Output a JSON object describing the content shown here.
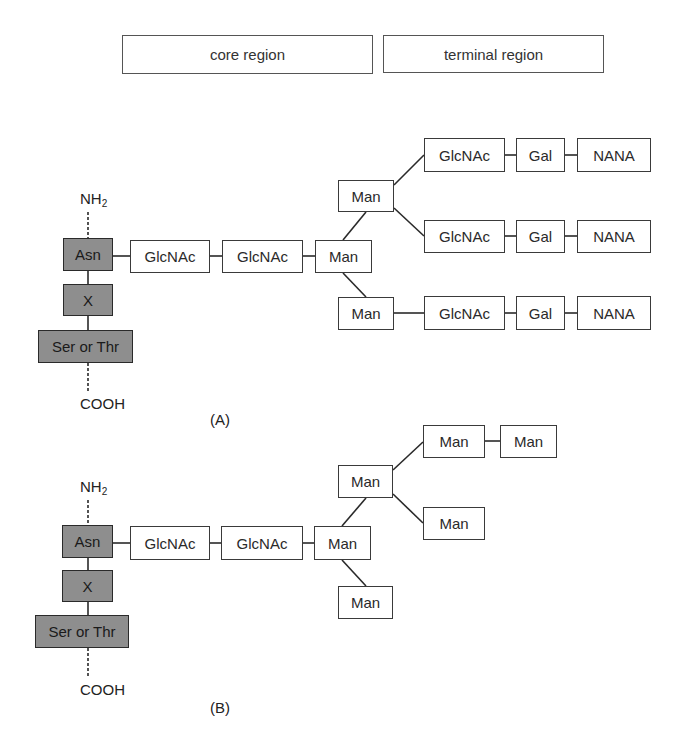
{
  "header": {
    "core_region": "core region",
    "terminal_region": "terminal region"
  },
  "panelA": {
    "caption": "(A)",
    "n_terminus": "NH",
    "n_terminus_sub": "2",
    "c_terminus": "COOH",
    "peptide": [
      "Asn",
      "X",
      "Ser or Thr"
    ],
    "core": [
      "GlcNAc",
      "GlcNAc",
      "Man",
      "Man",
      "Man"
    ],
    "branches": [
      [
        "GlcNAc",
        "Gal",
        "NANA"
      ],
      [
        "GlcNAc",
        "Gal",
        "NANA"
      ],
      [
        "GlcNAc",
        "Gal",
        "NANA"
      ]
    ]
  },
  "panelB": {
    "caption": "(B)",
    "n_terminus": "NH",
    "n_terminus_sub": "2",
    "c_terminus": "COOH",
    "peptide": [
      "Asn",
      "X",
      "Ser or Thr"
    ],
    "core": [
      "GlcNAc",
      "GlcNAc",
      "Man",
      "Man",
      "Man"
    ],
    "branches": [
      [
        "Man",
        "Man"
      ],
      [
        "Man"
      ]
    ]
  },
  "colors": {
    "amino_acid_fill": "#8e8e8e",
    "sugar_fill": "#ffffff",
    "stroke": "#3a3a3a"
  }
}
